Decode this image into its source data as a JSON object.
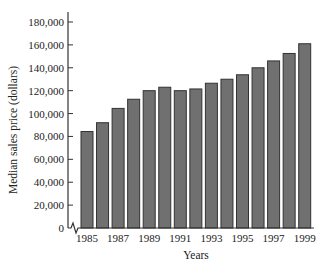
{
  "chart_data": {
    "type": "bar",
    "title": "",
    "xlabel": "Years",
    "ylabel": "Median sales price (dollars)",
    "ylim": [
      0,
      180000
    ],
    "yticks": [
      0,
      20000,
      40000,
      60000,
      80000,
      100000,
      120000,
      140000,
      160000,
      180000
    ],
    "ytick_labels": [
      "0",
      "20,000",
      "40,000",
      "60,000",
      "80,000",
      "100,000",
      "120,000",
      "140,000",
      "160,000",
      "180,000"
    ],
    "categories": [
      "1985",
      "1986",
      "1987",
      "1988",
      "1989",
      "1990",
      "1991",
      "1992",
      "1993",
      "1994",
      "1995",
      "1996",
      "1997",
      "1998",
      "1999"
    ],
    "xtick_labels": [
      "1985",
      "1987",
      "1989",
      "1991",
      "1993",
      "1995",
      "1997",
      "1999"
    ],
    "values": [
      84300,
      92000,
      104500,
      112500,
      120000,
      123000,
      120000,
      121500,
      126500,
      130000,
      133900,
      140000,
      146000,
      152500,
      161000
    ],
    "grid": false,
    "legend": null,
    "axis_break": "y-axis break symbol near origin",
    "colors": {
      "bar_fill": "#707070",
      "bar_stroke": "#333333",
      "axis": "#333333"
    }
  }
}
